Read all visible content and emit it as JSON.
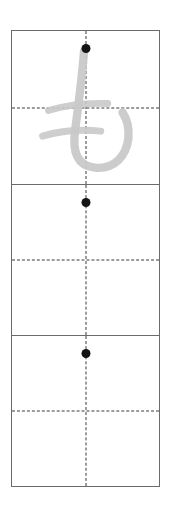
{
  "worksheet": {
    "title": "Hiragana writing practice grid",
    "script": "hiragana",
    "character": "も",
    "romaji": "mo",
    "stroke_count": 3,
    "background_color": "#ffffff",
    "border_color": "#6b6b6b",
    "guide_line_color": "#3a3a3a",
    "start_dot_color": "#141414",
    "model_stroke_color": "#c9c9c9",
    "cell_count": 3,
    "cells": [
      {
        "index": 1,
        "label": "model-cell",
        "has_model_character": true,
        "has_start_dot": true,
        "character": "も"
      },
      {
        "index": 2,
        "label": "practice-cell",
        "has_model_character": false,
        "has_start_dot": true,
        "character": ""
      },
      {
        "index": 3,
        "label": "practice-cell",
        "has_model_character": false,
        "has_start_dot": true,
        "character": ""
      }
    ],
    "guides": {
      "horizontal_label": "horizontal-center-guide",
      "vertical_label": "vertical-center-guide"
    }
  }
}
